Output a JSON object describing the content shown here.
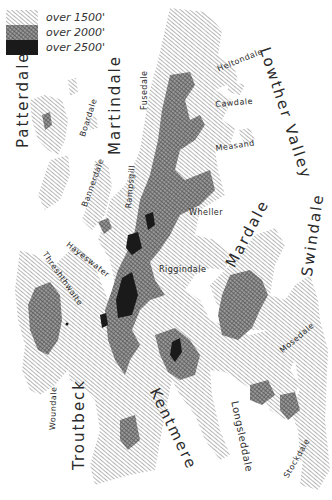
{
  "map": {
    "type": "relief-map",
    "legend": [
      {
        "label": "over 1500'",
        "pattern": "light-hatch"
      },
      {
        "label": "over 2000'",
        "pattern": "dark-crosshatch"
      },
      {
        "label": "over 2500'",
        "pattern": "solid-black"
      }
    ],
    "colors": {
      "hatch_light": "#8a8a8a",
      "hatch_dark": "#555555",
      "solid": "#1a1a1a",
      "background": "#ffffff",
      "text": "#2a2a2a"
    },
    "valleys": [
      {
        "name": "Lowther Valley"
      },
      {
        "name": "Patterdale"
      },
      {
        "name": "Martindale"
      },
      {
        "name": "Mardale"
      },
      {
        "name": "Swindale"
      },
      {
        "name": "Troutbeck"
      },
      {
        "name": "Kentmere"
      },
      {
        "name": "Longsleddale"
      }
    ],
    "small_dales": [
      {
        "name": "Heltondale"
      },
      {
        "name": "Cawdale"
      },
      {
        "name": "Measand"
      },
      {
        "name": "Fusedale"
      },
      {
        "name": "Boardale"
      },
      {
        "name": "Bannerdale"
      },
      {
        "name": "Rampsgill"
      },
      {
        "name": "Wheller"
      },
      {
        "name": "Riggindale"
      },
      {
        "name": "Hayeswater"
      },
      {
        "name": "Threshthwaite"
      },
      {
        "name": "Mosedale"
      },
      {
        "name": "Woundale"
      },
      {
        "name": "Stockdale"
      }
    ]
  }
}
